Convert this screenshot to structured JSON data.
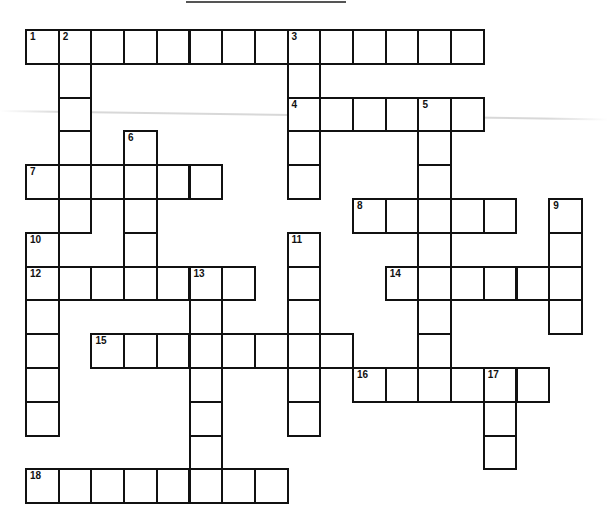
{
  "puzzle": {
    "type": "crossword",
    "grid": {
      "origin_x": 25,
      "origin_y": 29,
      "cell_w": 32.7,
      "cell_h": 33.8,
      "border_color": "#111111",
      "background": "#ffffff"
    },
    "entries": [
      {
        "number": 1,
        "direction": "across",
        "row": 0,
        "col": 0,
        "length": 14
      },
      {
        "number": 2,
        "direction": "down",
        "row": 0,
        "col": 1,
        "length": 6
      },
      {
        "number": 3,
        "direction": "down",
        "row": 0,
        "col": 8,
        "length": 5
      },
      {
        "number": 4,
        "direction": "across",
        "row": 2,
        "col": 8,
        "length": 6
      },
      {
        "number": 5,
        "direction": "down",
        "row": 2,
        "col": 12,
        "length": 9
      },
      {
        "number": 6,
        "direction": "down",
        "row": 3,
        "col": 3,
        "length": 5
      },
      {
        "number": 7,
        "direction": "across",
        "row": 4,
        "col": 0,
        "length": 6
      },
      {
        "number": 8,
        "direction": "across",
        "row": 5,
        "col": 10,
        "length": 5
      },
      {
        "number": 9,
        "direction": "down",
        "row": 5,
        "col": 16,
        "length": 4
      },
      {
        "number": 10,
        "direction": "down",
        "row": 6,
        "col": 0,
        "length": 6
      },
      {
        "number": 11,
        "direction": "down",
        "row": 6,
        "col": 8,
        "length": 6
      },
      {
        "number": 12,
        "direction": "across",
        "row": 7,
        "col": 0,
        "length": 7
      },
      {
        "number": 13,
        "direction": "down",
        "row": 7,
        "col": 5,
        "length": 7
      },
      {
        "number": 14,
        "direction": "across",
        "row": 7,
        "col": 11,
        "length": 6
      },
      {
        "number": 15,
        "direction": "across",
        "row": 9,
        "col": 2,
        "length": 8
      },
      {
        "number": 16,
        "direction": "across",
        "row": 10,
        "col": 10,
        "length": 6
      },
      {
        "number": 17,
        "direction": "down",
        "row": 10,
        "col": 14,
        "length": 3
      },
      {
        "number": 18,
        "direction": "across",
        "row": 13,
        "col": 0,
        "length": 8
      }
    ]
  }
}
